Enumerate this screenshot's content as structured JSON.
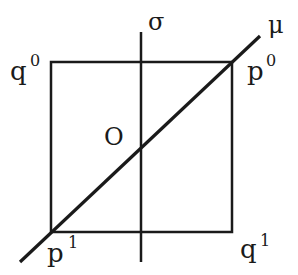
{
  "diagram": {
    "labels": {
      "sigma": "σ",
      "mu": "μ",
      "origin": "O",
      "q0_base": "q",
      "q0_sup": "0",
      "p0_base": "p",
      "p0_sup": "0",
      "p1_base": "p",
      "p1_sup": "1",
      "q1_base": "q",
      "q1_sup": "1"
    },
    "colors": {
      "stroke": "#1a1a1a",
      "background": "#ffffff"
    }
  }
}
